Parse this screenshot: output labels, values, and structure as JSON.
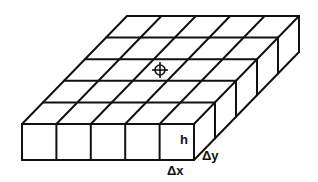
{
  "diagram": {
    "type": "isometric-grid-block",
    "grid": {
      "columns": 5,
      "rows": 5
    },
    "labels": {
      "height": "h",
      "dy": "Δy",
      "dx": "Δx"
    },
    "marker": "crosshair-symbol",
    "colors": {
      "line": "#111111",
      "background": "#ffffff"
    }
  }
}
